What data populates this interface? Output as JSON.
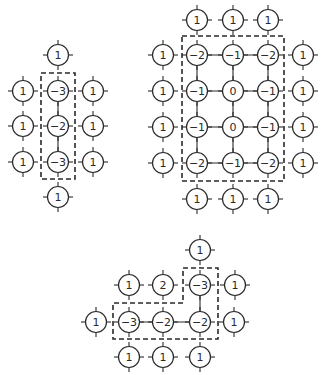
{
  "style": {
    "stroke_color": "#2a2a2a",
    "background": "#ffffff",
    "node_radius": 10.5
  },
  "diagrams": [
    {
      "name": "left-column-cluster",
      "nodes": [
        {
          "x": 58,
          "y": 55,
          "label": "1"
        },
        {
          "x": 23,
          "y": 91,
          "label": "1"
        },
        {
          "x": 58,
          "y": 91,
          "label": "-3"
        },
        {
          "x": 93,
          "y": 91,
          "label": "1"
        },
        {
          "x": 23,
          "y": 126,
          "label": "1"
        },
        {
          "x": 58,
          "y": 126,
          "label": "-2"
        },
        {
          "x": 93,
          "y": 126,
          "label": "1"
        },
        {
          "x": 23,
          "y": 162,
          "label": "1"
        },
        {
          "x": 58,
          "y": 162,
          "label": "-3"
        },
        {
          "x": 93,
          "y": 162,
          "label": "1"
        },
        {
          "x": 58,
          "y": 197,
          "label": "1"
        }
      ],
      "edges": [
        [
          2,
          5
        ],
        [
          5,
          8
        ]
      ],
      "boxes": [
        "M41,73 L75,73 L75,179 L41,179 Z"
      ]
    },
    {
      "name": "right-grid-cluster",
      "nodes": [
        {
          "x": 197,
          "y": 20,
          "label": "1"
        },
        {
          "x": 233,
          "y": 20,
          "label": "1"
        },
        {
          "x": 268,
          "y": 20,
          "label": "1"
        },
        {
          "x": 163,
          "y": 55,
          "label": "1"
        },
        {
          "x": 197,
          "y": 55,
          "label": "-2"
        },
        {
          "x": 233,
          "y": 55,
          "label": "-1"
        },
        {
          "x": 268,
          "y": 55,
          "label": "-2"
        },
        {
          "x": 303,
          "y": 55,
          "label": "1"
        },
        {
          "x": 163,
          "y": 91,
          "label": "1"
        },
        {
          "x": 197,
          "y": 91,
          "label": "-1"
        },
        {
          "x": 233,
          "y": 91,
          "label": "0"
        },
        {
          "x": 268,
          "y": 91,
          "label": "-1"
        },
        {
          "x": 303,
          "y": 91,
          "label": "1"
        },
        {
          "x": 163,
          "y": 127,
          "label": "1"
        },
        {
          "x": 197,
          "y": 127,
          "label": "-1"
        },
        {
          "x": 233,
          "y": 127,
          "label": "0"
        },
        {
          "x": 268,
          "y": 127,
          "label": "-1"
        },
        {
          "x": 303,
          "y": 127,
          "label": "1"
        },
        {
          "x": 163,
          "y": 163,
          "label": "1"
        },
        {
          "x": 197,
          "y": 163,
          "label": "-2"
        },
        {
          "x": 233,
          "y": 163,
          "label": "-1"
        },
        {
          "x": 268,
          "y": 163,
          "label": "-2"
        },
        {
          "x": 303,
          "y": 163,
          "label": "1"
        },
        {
          "x": 197,
          "y": 199,
          "label": "1"
        },
        {
          "x": 233,
          "y": 199,
          "label": "1"
        },
        {
          "x": 268,
          "y": 199,
          "label": "1"
        }
      ],
      "edges": [
        [
          4,
          5
        ],
        [
          5,
          6
        ],
        [
          9,
          10
        ],
        [
          10,
          11
        ],
        [
          14,
          15
        ],
        [
          15,
          16
        ],
        [
          19,
          20
        ],
        [
          20,
          21
        ],
        [
          4,
          9
        ],
        [
          9,
          14
        ],
        [
          14,
          19
        ],
        [
          5,
          10
        ],
        [
          10,
          15
        ],
        [
          15,
          20
        ],
        [
          6,
          11
        ],
        [
          11,
          16
        ],
        [
          16,
          21
        ]
      ],
      "boxes": [
        "M182,36 L284,36 L284,181 L182,181 Z"
      ]
    },
    {
      "name": "bottom-l-cluster",
      "nodes": [
        {
          "x": 200,
          "y": 250,
          "label": "1"
        },
        {
          "x": 129,
          "y": 285,
          "label": "1"
        },
        {
          "x": 163,
          "y": 285,
          "label": "2"
        },
        {
          "x": 200,
          "y": 285,
          "label": "-3"
        },
        {
          "x": 235,
          "y": 285,
          "label": "1"
        },
        {
          "x": 96,
          "y": 322,
          "label": "1"
        },
        {
          "x": 129,
          "y": 322,
          "label": "-3"
        },
        {
          "x": 163,
          "y": 322,
          "label": "-2"
        },
        {
          "x": 200,
          "y": 322,
          "label": "-2"
        },
        {
          "x": 234,
          "y": 322,
          "label": "1"
        },
        {
          "x": 129,
          "y": 357,
          "label": "1"
        },
        {
          "x": 163,
          "y": 357,
          "label": "1"
        },
        {
          "x": 200,
          "y": 357,
          "label": "1"
        }
      ],
      "edges": [
        [
          3,
          8
        ],
        [
          6,
          7
        ],
        [
          7,
          8
        ]
      ],
      "boxes": [
        "M183,268 L218,268 L218,339 L113,339 L113,303 L183,303 Z"
      ]
    }
  ]
}
